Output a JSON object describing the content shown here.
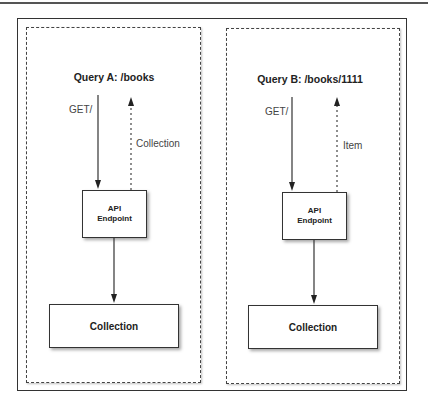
{
  "diagram": {
    "panels": [
      {
        "id": "query-a",
        "title": "Query A: /books",
        "request_label": "GET/",
        "response_label": "Collection",
        "endpoint_label_line1": "API",
        "endpoint_label_line2": "Endpoint",
        "resource_label": "Collection"
      },
      {
        "id": "query-b",
        "title": "Query B: /books/1111",
        "request_label": "GET/",
        "response_label": "Item",
        "endpoint_label_line1": "API",
        "endpoint_label_line2": "Endpoint",
        "resource_label": "Collection"
      }
    ],
    "colors": {
      "stroke": "#333333",
      "text": "#222222",
      "label": "#444444",
      "background": "#ffffff"
    }
  }
}
